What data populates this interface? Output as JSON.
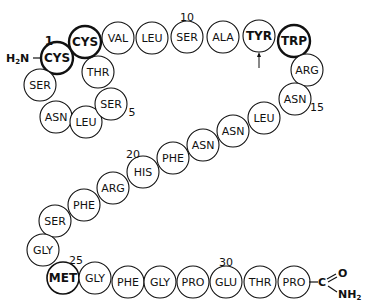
{
  "diagram": {
    "title": "",
    "n_terminus": "H2N",
    "c_terminus": {
      "carbon": "C",
      "oxygen": "O",
      "amide": "NH2"
    },
    "residues": [
      {
        "pos": 1,
        "name": "CYS",
        "x": 57,
        "y": 58,
        "style": "bold",
        "label": "1"
      },
      {
        "pos": 2,
        "name": "SER",
        "x": 40,
        "y": 85,
        "style": "normal"
      },
      {
        "pos": 3,
        "name": "ASN",
        "x": 56,
        "y": 117,
        "style": "normal"
      },
      {
        "pos": 4,
        "name": "LEU",
        "x": 86,
        "y": 122,
        "style": "normal"
      },
      {
        "pos": 5,
        "name": "SER",
        "x": 111,
        "y": 104,
        "style": "normal",
        "label": "5"
      },
      {
        "pos": 6,
        "name": "THR",
        "x": 98,
        "y": 72,
        "style": "normal"
      },
      {
        "pos": 7,
        "name": "CYS",
        "x": 85,
        "y": 42,
        "style": "bold"
      },
      {
        "pos": 8,
        "name": "VAL",
        "x": 118,
        "y": 38,
        "style": "normal"
      },
      {
        "pos": 9,
        "name": "LEU",
        "x": 152,
        "y": 38,
        "style": "normal"
      },
      {
        "pos": 10,
        "name": "SER",
        "x": 187,
        "y": 37,
        "style": "normal",
        "label": "10"
      },
      {
        "pos": 11,
        "name": "ALA",
        "x": 223,
        "y": 37,
        "style": "normal"
      },
      {
        "pos": 12,
        "name": "TYR",
        "x": 259,
        "y": 36,
        "style": "bold-text",
        "arrow": true
      },
      {
        "pos": 13,
        "name": "TRP",
        "x": 294,
        "y": 41,
        "style": "bold"
      },
      {
        "pos": 14,
        "name": "ARG",
        "x": 307,
        "y": 70,
        "style": "normal"
      },
      {
        "pos": 15,
        "name": "ASN",
        "x": 295,
        "y": 99,
        "style": "normal",
        "label": "15"
      },
      {
        "pos": 16,
        "name": "LEU",
        "x": 264,
        "y": 118,
        "style": "normal"
      },
      {
        "pos": 17,
        "name": "ASN",
        "x": 233,
        "y": 131,
        "style": "normal"
      },
      {
        "pos": 18,
        "name": "ASN",
        "x": 203,
        "y": 145,
        "style": "normal"
      },
      {
        "pos": 19,
        "name": "PHE",
        "x": 173,
        "y": 158,
        "style": "normal"
      },
      {
        "pos": 20,
        "name": "HIS",
        "x": 143,
        "y": 172,
        "style": "normal",
        "label": "20"
      },
      {
        "pos": 21,
        "name": "ARG",
        "x": 113,
        "y": 188,
        "style": "normal"
      },
      {
        "pos": 22,
        "name": "PHE",
        "x": 84,
        "y": 205,
        "style": "normal"
      },
      {
        "pos": 23,
        "name": "SER",
        "x": 55,
        "y": 221,
        "style": "normal"
      },
      {
        "pos": 24,
        "name": "GLY",
        "x": 43,
        "y": 250,
        "style": "normal"
      },
      {
        "pos": 25,
        "name": "MET",
        "x": 63,
        "y": 278,
        "style": "hatched",
        "label": "25"
      },
      {
        "pos": 26,
        "name": "GLY",
        "x": 95,
        "y": 278,
        "style": "normal"
      },
      {
        "pos": 27,
        "name": "PHE",
        "x": 128,
        "y": 282,
        "style": "normal"
      },
      {
        "pos": 28,
        "name": "GLY",
        "x": 160,
        "y": 282,
        "style": "normal"
      },
      {
        "pos": 29,
        "name": "PRO",
        "x": 193,
        "y": 282,
        "style": "normal"
      },
      {
        "pos": 30,
        "name": "GLU",
        "x": 226,
        "y": 282,
        "style": "normal",
        "label": "30"
      },
      {
        "pos": 31,
        "name": "THR",
        "x": 260,
        "y": 282,
        "style": "normal"
      },
      {
        "pos": 32,
        "name": "PRO",
        "x": 294,
        "y": 282,
        "style": "normal"
      }
    ]
  }
}
